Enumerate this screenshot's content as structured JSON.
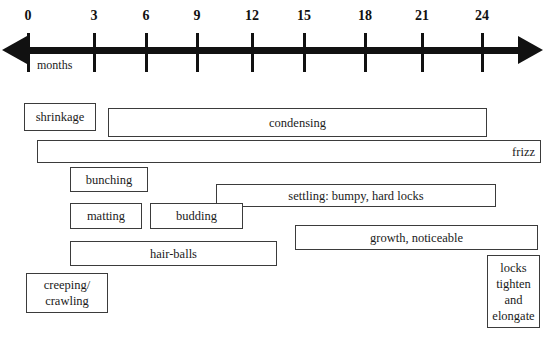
{
  "diagram": {
    "axis": {
      "unit_label": "months",
      "ticks": [
        {
          "value": "0",
          "x": 28
        },
        {
          "value": "3",
          "x": 94
        },
        {
          "value": "6",
          "x": 146
        },
        {
          "value": "9",
          "x": 197
        },
        {
          "value": "12",
          "x": 252
        },
        {
          "value": "15",
          "x": 304
        },
        {
          "value": "18",
          "x": 365
        },
        {
          "value": "21",
          "x": 422
        },
        {
          "value": "24",
          "x": 482
        }
      ],
      "left_arrow_icon": "arrow-left-icon",
      "right_arrow_icon": "arrow-right-icon",
      "line_color": "#111111"
    },
    "phases": [
      {
        "label": "shrinkage",
        "x": 24,
        "y": 103,
        "w": 72,
        "h": 28,
        "align": "center",
        "multiline": false
      },
      {
        "label": "condensing",
        "x": 108,
        "y": 108,
        "w": 379,
        "h": 29,
        "align": "center",
        "multiline": false
      },
      {
        "label": "frizz",
        "x": 37,
        "y": 140,
        "w": 504,
        "h": 23,
        "align": "right",
        "multiline": false
      },
      {
        "label": "bunching",
        "x": 70,
        "y": 167,
        "w": 78,
        "h": 25,
        "align": "center",
        "multiline": false
      },
      {
        "label": "settling: bumpy, hard locks",
        "x": 216,
        "y": 184,
        "w": 280,
        "h": 23,
        "align": "center",
        "multiline": false
      },
      {
        "label": "matting",
        "x": 70,
        "y": 203,
        "w": 72,
        "h": 26,
        "align": "center",
        "multiline": false
      },
      {
        "label": "budding",
        "x": 150,
        "y": 203,
        "w": 93,
        "h": 26,
        "align": "center",
        "multiline": false
      },
      {
        "label": "growth, noticeable",
        "x": 295,
        "y": 225,
        "w": 243,
        "h": 25,
        "align": "center",
        "multiline": false
      },
      {
        "label": "hair-balls",
        "x": 70,
        "y": 241,
        "w": 207,
        "h": 25,
        "align": "center",
        "multiline": false
      },
      {
        "label": "creeping/\ncrawling",
        "x": 26,
        "y": 273,
        "w": 82,
        "h": 40,
        "align": "center",
        "multiline": true
      },
      {
        "label": "locks\ntighten\nand\nelongate",
        "x": 487,
        "y": 255,
        "w": 53,
        "h": 73,
        "align": "center",
        "multiline": true
      }
    ]
  },
  "colors": {
    "ink": "#111111",
    "box_border": "#3b3b3b",
    "background": "#ffffff"
  }
}
